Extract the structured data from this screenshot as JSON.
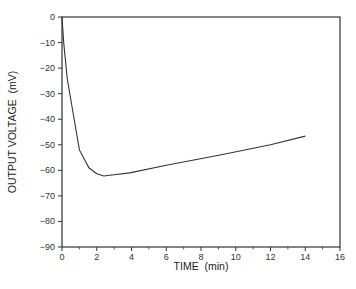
{
  "chart_data": {
    "type": "line",
    "title": "",
    "xlabel": "TIME  (min)",
    "ylabel": "OUTPUT VOLTAGE  (mV)",
    "xlim": [
      0,
      16
    ],
    "ylim": [
      -90,
      0
    ],
    "xticks": [
      0,
      2,
      4,
      6,
      8,
      10,
      12,
      14,
      16
    ],
    "xminor_ticks": [
      1,
      3,
      5,
      7,
      9,
      11,
      13,
      15
    ],
    "yticks": [
      0,
      -10,
      -20,
      -30,
      -40,
      -50,
      -60,
      -70,
      -80,
      -90
    ],
    "grid": false,
    "legend": null,
    "series": [
      {
        "name": "output voltage",
        "color": "#333333",
        "x": [
          0,
          0.1,
          0.3,
          0.6,
          1.0,
          1.55,
          2.0,
          2.4,
          3.0,
          3.9,
          6.0,
          9.1,
          12.0,
          14.0
        ],
        "y": [
          0,
          -10,
          -24,
          -36,
          -52,
          -59,
          -61.3,
          -62.2,
          -61.7,
          -61,
          -58,
          -54,
          -50,
          -46.6
        ]
      }
    ]
  }
}
